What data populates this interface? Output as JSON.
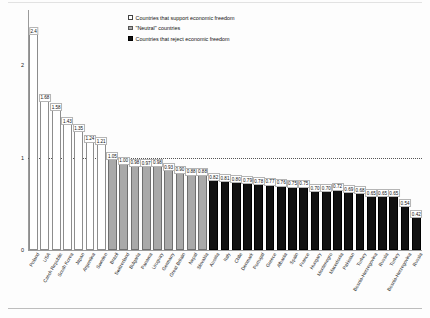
{
  "chart_data": {
    "type": "bar",
    "title": "",
    "xlabel": "",
    "ylabel": "",
    "ylim": [
      0,
      2.6
    ],
    "yticks": [
      0,
      1,
      2
    ],
    "ytick_labels": [
      "0",
      "1",
      "2"
    ],
    "grid": true,
    "gridlines": [
      1
    ],
    "legend_position": "top-center",
    "legend": [
      {
        "label": "Countries that support economic freedom",
        "color": "#ffffff",
        "group": "support"
      },
      {
        "label": "\"Neutral\" countries",
        "color": "#a9a9a9",
        "group": "neutral"
      },
      {
        "label": "Countries that reject economic freedom",
        "color": "#111111",
        "group": "reject"
      }
    ],
    "categories": [
      "Poland",
      "USA",
      "Czech Republic",
      "South Korea",
      "Japan",
      "Argentina",
      "Sweden",
      "Brazil",
      "Switzerland",
      "Bulgaria",
      "Panama",
      "Uruguay",
      "Germany",
      "Great Britain",
      "Nepal",
      "Slovakia",
      "Austria",
      "Italy",
      "Chile",
      "Denmark",
      "Portugal",
      "Greece",
      "Albania",
      "Spain",
      "France",
      "Hungary",
      "Montenegro",
      "Macedonia",
      "Pakistan",
      "Turkey",
      "Bosnia-Herzegovina",
      "Russia"
    ],
    "values": [
      2.4,
      1.68,
      1.58,
      1.43,
      1.35,
      1.24,
      1.21,
      1.05,
      1.0,
      0.98,
      0.97,
      0.98,
      0.93,
      0.9,
      0.88,
      0.88,
      0.82,
      0.81,
      0.8,
      0.79,
      0.78,
      0.77,
      0.76,
      0.75,
      0.75,
      0.7,
      0.7,
      0.72,
      0.69,
      0.68,
      0.65,
      0.65
    ],
    "value_labels": [
      "2.4",
      "1.68",
      "1.58",
      "1.43",
      "1.35",
      "1.24",
      "1.21",
      "1.05",
      "1.00",
      "0.98",
      "0.97",
      "0.98",
      "0.93",
      "0.90",
      "0.88",
      "0.88",
      "0.82",
      "0.81",
      "0.80",
      "0.79",
      "0.78",
      "0.77",
      "0.76",
      "0.75",
      "0.75",
      "0.70",
      "0.70",
      "0.72",
      "0.69",
      "0.68",
      "0.65",
      "0.65"
    ],
    "groups": [
      "support",
      "support",
      "support",
      "support",
      "support",
      "support",
      "support",
      "neutral",
      "neutral",
      "neutral",
      "neutral",
      "neutral",
      "neutral",
      "neutral",
      "neutral",
      "neutral",
      "reject",
      "reject",
      "reject",
      "reject",
      "reject",
      "reject",
      "reject",
      "reject",
      "reject",
      "reject",
      "reject",
      "reject",
      "reject",
      "reject",
      "reject",
      "reject"
    ],
    "extra_tail": {
      "categories": [
        "Turkey",
        "Bosnia-Herzegovina",
        "Russia"
      ],
      "values": [
        0.65,
        0.54,
        0.42
      ],
      "value_labels": [
        "0.65",
        "0.54",
        "0.42"
      ]
    }
  },
  "colors": {
    "support_fill": "#ffffff",
    "support_border": "#8d8d8d",
    "neutral_fill": "#a9a9a9",
    "neutral_border": "#6f6f6f",
    "reject_fill": "#111111",
    "reject_border": "#000000",
    "axis": "#9a9a9a",
    "text": "#111111"
  }
}
